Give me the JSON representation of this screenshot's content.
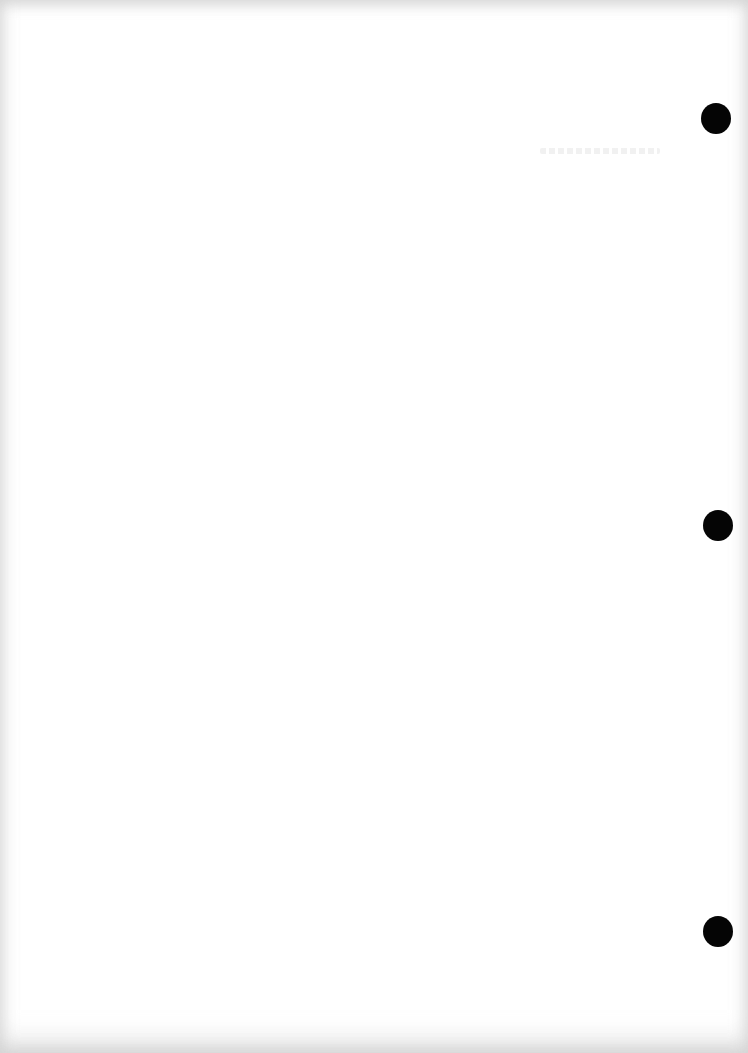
{
  "document": {
    "type": "blank scanned page",
    "background_color": "#ffffff",
    "text_content": "",
    "punch_holes": [
      {
        "cx": 716,
        "cy": 118,
        "diameter": 30
      },
      {
        "cx": 718,
        "cy": 525,
        "diameter": 30
      },
      {
        "cx": 718,
        "cy": 931,
        "diameter": 30
      }
    ],
    "hole_color": "#050505"
  }
}
